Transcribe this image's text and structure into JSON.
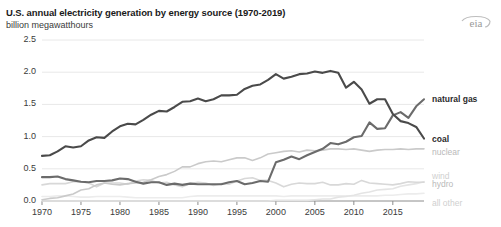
{
  "header": {
    "title": "U.S. annual electricity generation by energy source (1970-2019)",
    "subtitle": "billion megawatthours",
    "logo_text": "eia"
  },
  "chart_data": {
    "type": "line",
    "title": "U.S. annual electricity generation by energy source (1970-2019)",
    "subtitle": "billion megawatthours",
    "xlabel": "",
    "ylabel": "billion megawatthours",
    "xlim": [
      1970,
      2019
    ],
    "ylim": [
      0.0,
      2.5
    ],
    "yticks": [
      0.0,
      0.5,
      1.0,
      1.5,
      2.0,
      2.5
    ],
    "ytick_labels": [
      "0.0",
      "0.5",
      "1.0",
      "1.5",
      "2.0",
      "2.5"
    ],
    "xticks": [
      1970,
      1975,
      1980,
      1985,
      1990,
      1995,
      2000,
      2005,
      2010,
      2015
    ],
    "xtick_labels": [
      "1970",
      "1975",
      "1980",
      "1985",
      "1990",
      "1995",
      "2000",
      "2005",
      "2010",
      "2015"
    ],
    "grid": true,
    "grid_axis": "y",
    "legend_position": "right-inline",
    "x": [
      1970,
      1971,
      1972,
      1973,
      1974,
      1975,
      1976,
      1977,
      1978,
      1979,
      1980,
      1981,
      1982,
      1983,
      1984,
      1985,
      1986,
      1987,
      1988,
      1989,
      1990,
      1991,
      1992,
      1993,
      1994,
      1995,
      1996,
      1997,
      1998,
      1999,
      2000,
      2001,
      2002,
      2003,
      2004,
      2005,
      2006,
      2007,
      2008,
      2009,
      2010,
      2011,
      2012,
      2013,
      2014,
      2015,
      2016,
      2017,
      2018,
      2019
    ],
    "series": [
      {
        "name": "coal",
        "color": "#4a4a4a",
        "label": "coal",
        "values": [
          0.7,
          0.71,
          0.77,
          0.85,
          0.83,
          0.85,
          0.94,
          0.99,
          0.98,
          1.08,
          1.16,
          1.2,
          1.19,
          1.26,
          1.34,
          1.4,
          1.39,
          1.46,
          1.54,
          1.55,
          1.59,
          1.55,
          1.58,
          1.64,
          1.64,
          1.65,
          1.74,
          1.79,
          1.81,
          1.88,
          1.97,
          1.9,
          1.93,
          1.97,
          1.98,
          2.01,
          1.99,
          2.02,
          1.99,
          1.76,
          1.85,
          1.73,
          1.51,
          1.58,
          1.58,
          1.35,
          1.24,
          1.21,
          1.15,
          0.97
        ]
      },
      {
        "name": "natural gas",
        "color": "#6b6b6b",
        "label": "natural gas",
        "values": [
          0.37,
          0.37,
          0.38,
          0.34,
          0.32,
          0.3,
          0.29,
          0.31,
          0.31,
          0.32,
          0.35,
          0.34,
          0.3,
          0.27,
          0.29,
          0.29,
          0.25,
          0.27,
          0.25,
          0.27,
          0.26,
          0.26,
          0.26,
          0.26,
          0.29,
          0.31,
          0.26,
          0.28,
          0.31,
          0.3,
          0.6,
          0.64,
          0.69,
          0.65,
          0.71,
          0.76,
          0.81,
          0.9,
          0.88,
          0.92,
          0.99,
          1.01,
          1.22,
          1.12,
          1.13,
          1.33,
          1.38,
          1.29,
          1.47,
          1.58
        ]
      },
      {
        "name": "nuclear",
        "color": "#cacaca",
        "label": "nuclear",
        "values": [
          0.02,
          0.04,
          0.05,
          0.08,
          0.11,
          0.17,
          0.19,
          0.25,
          0.28,
          0.26,
          0.25,
          0.27,
          0.28,
          0.29,
          0.33,
          0.38,
          0.41,
          0.46,
          0.53,
          0.53,
          0.58,
          0.61,
          0.62,
          0.61,
          0.64,
          0.67,
          0.67,
          0.63,
          0.67,
          0.73,
          0.75,
          0.77,
          0.78,
          0.76,
          0.79,
          0.78,
          0.79,
          0.81,
          0.81,
          0.8,
          0.81,
          0.79,
          0.77,
          0.79,
          0.8,
          0.8,
          0.81,
          0.8,
          0.81,
          0.81
        ]
      },
      {
        "name": "hydro",
        "color": "#d8d8d8",
        "label": "hydro",
        "values": [
          0.25,
          0.27,
          0.27,
          0.27,
          0.3,
          0.3,
          0.28,
          0.22,
          0.28,
          0.28,
          0.28,
          0.26,
          0.31,
          0.33,
          0.32,
          0.28,
          0.29,
          0.25,
          0.22,
          0.27,
          0.29,
          0.28,
          0.24,
          0.27,
          0.26,
          0.31,
          0.35,
          0.36,
          0.32,
          0.32,
          0.28,
          0.22,
          0.26,
          0.28,
          0.27,
          0.27,
          0.29,
          0.25,
          0.25,
          0.27,
          0.26,
          0.32,
          0.28,
          0.27,
          0.26,
          0.25,
          0.27,
          0.3,
          0.29,
          0.29
        ]
      },
      {
        "name": "wind",
        "color": "#e4e4e4",
        "label": "wind",
        "values": [
          0.0,
          0.0,
          0.0,
          0.0,
          0.0,
          0.0,
          0.0,
          0.0,
          0.0,
          0.0,
          0.0,
          0.0,
          0.0,
          0.0,
          0.0,
          0.0,
          0.0,
          0.0,
          0.0,
          0.0,
          0.0,
          0.0,
          0.0,
          0.0,
          0.0,
          0.0,
          0.0,
          0.0,
          0.0,
          0.0,
          0.01,
          0.01,
          0.01,
          0.01,
          0.01,
          0.02,
          0.03,
          0.03,
          0.06,
          0.07,
          0.09,
          0.12,
          0.14,
          0.17,
          0.18,
          0.19,
          0.23,
          0.25,
          0.27,
          0.3
        ]
      },
      {
        "name": "all other",
        "color": "#ececec",
        "label": "all other",
        "values": [
          0.07,
          0.07,
          0.08,
          0.08,
          0.07,
          0.06,
          0.06,
          0.07,
          0.07,
          0.07,
          0.07,
          0.06,
          0.05,
          0.05,
          0.05,
          0.05,
          0.05,
          0.05,
          0.05,
          0.07,
          0.08,
          0.08,
          0.08,
          0.08,
          0.08,
          0.08,
          0.08,
          0.08,
          0.08,
          0.08,
          0.08,
          0.07,
          0.08,
          0.08,
          0.08,
          0.08,
          0.08,
          0.08,
          0.08,
          0.08,
          0.08,
          0.08,
          0.08,
          0.08,
          0.09,
          0.09,
          0.1,
          0.11,
          0.11,
          0.12
        ]
      }
    ],
    "annotations": [
      {
        "name": "natural gas",
        "x": 2019,
        "y": 1.58
      },
      {
        "name": "coal",
        "x": 2019,
        "y": 0.97
      },
      {
        "name": "nuclear",
        "x": 2019,
        "y": 0.81
      },
      {
        "name": "wind",
        "x": 2019,
        "y": 0.3
      },
      {
        "name": "hydro",
        "x": 2019,
        "y": 0.29
      },
      {
        "name": "all other",
        "x": 2019,
        "y": 0.12
      }
    ]
  },
  "series_labels": {
    "natural_gas": "natural gas",
    "coal": "coal",
    "nuclear": "nuclear",
    "wind": "wind",
    "hydro": "hydro",
    "all_other": "all other"
  }
}
